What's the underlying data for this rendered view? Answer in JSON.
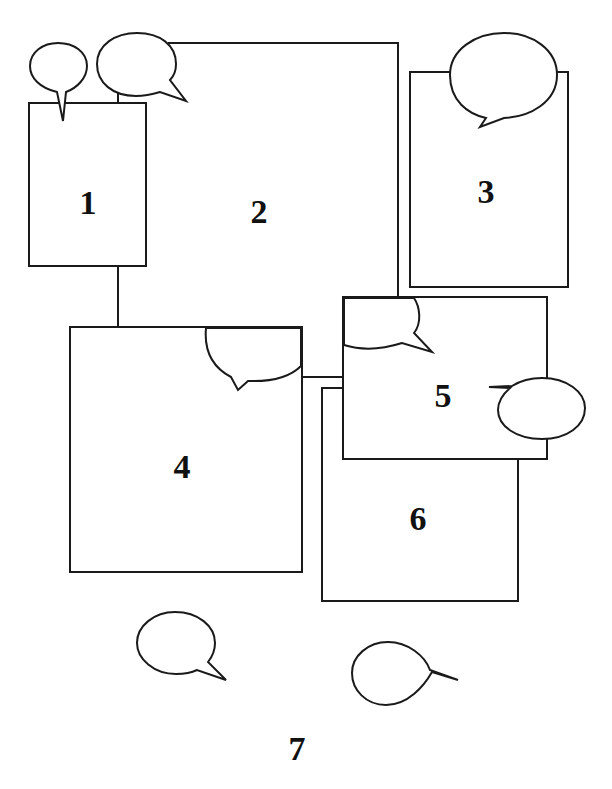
{
  "diagram": {
    "type": "floor-plan / region diagram with speech bubbles",
    "stroke_color": "#1a1a1a",
    "background": "#ffffff",
    "regions": [
      {
        "id": "1",
        "label": "1"
      },
      {
        "id": "2",
        "label": "2"
      },
      {
        "id": "3",
        "label": "3"
      },
      {
        "id": "4",
        "label": "4"
      },
      {
        "id": "5",
        "label": "5"
      },
      {
        "id": "6",
        "label": "6"
      },
      {
        "id": "7",
        "label": "7"
      }
    ],
    "speech_bubbles": [
      {
        "region": "1",
        "tail": "down"
      },
      {
        "region": "2",
        "tail": "down-right"
      },
      {
        "region": "3",
        "tail": "down-left"
      },
      {
        "region": "4",
        "tail": "down-left"
      },
      {
        "region": "5",
        "tail": "down-right"
      },
      {
        "region": "5",
        "tail": "left"
      },
      {
        "region": "7",
        "tail": "down-right"
      },
      {
        "region": "7",
        "tail": "right"
      }
    ]
  }
}
